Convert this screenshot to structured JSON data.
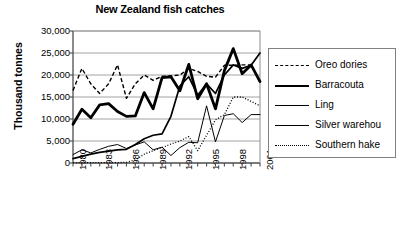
{
  "chart_data": {
    "type": "line",
    "title": "New Zealand fish catches",
    "xlabel": "",
    "ylabel": "Thousand tonnes",
    "ylim": [
      0,
      30000
    ],
    "ytick_labels": [
      "30,000",
      "25,000",
      "20,000",
      "15,000",
      "10,000",
      "5,000",
      "0"
    ],
    "ytick_values": [
      30000,
      25000,
      20000,
      15000,
      10000,
      5000,
      0
    ],
    "grid": "horizontal",
    "legend_position": "right",
    "x": [
      1980,
      1981,
      1982,
      1983,
      1984,
      1985,
      1986,
      1987,
      1988,
      1989,
      1990,
      1991,
      1992,
      1993,
      1994,
      1995,
      1996,
      1997,
      1998,
      1999,
      2000,
      2001
    ],
    "xtick_labels": [
      "1980",
      "1983",
      "1986",
      "1989",
      "1992",
      "1995",
      "1998",
      "2001"
    ],
    "xtick_values": [
      1980,
      1983,
      1986,
      1989,
      1992,
      1995,
      1998,
      2001
    ],
    "series": [
      {
        "name": "Oreo dories",
        "style": "dashed",
        "width": 1.4,
        "color": "#000000",
        "values": [
          16500,
          21500,
          18000,
          15800,
          18000,
          22300,
          14700,
          18000,
          20000,
          18800,
          19700,
          19800,
          20000,
          21500,
          20800,
          19700,
          19500,
          22200,
          22200,
          22300,
          22300,
          null
        ]
      },
      {
        "name": "Barracouta",
        "style": "solid",
        "width": 2.8,
        "color": "#000000",
        "values": [
          8800,
          12200,
          10300,
          13200,
          13500,
          11700,
          10600,
          10700,
          16000,
          12300,
          19400,
          19600,
          16400,
          22400,
          14600,
          18000,
          12300,
          21000,
          26000,
          20300,
          22300,
          18500
        ]
      },
      {
        "name": "Ling",
        "style": "solid",
        "width": 1.7,
        "color": "#000000",
        "values": [
          1000,
          1500,
          2000,
          2400,
          2700,
          3000,
          3100,
          4200,
          5500,
          6300,
          6600,
          10600,
          17500,
          19600,
          15400,
          18000,
          15800,
          20000,
          22300,
          21500,
          22200,
          25000
        ]
      },
      {
        "name": "Silver warehou",
        "style": "solid",
        "width": 1.0,
        "color": "#000000",
        "values": [
          1900,
          3000,
          2300,
          3100,
          3800,
          4200,
          3300,
          4100,
          4800,
          3000,
          3600,
          1700,
          3500,
          4700,
          4600,
          13000,
          4800,
          10800,
          11200,
          9200,
          11000,
          11000
        ]
      },
      {
        "name": "Southern hake",
        "style": "dotted",
        "width": 1.3,
        "color": "#000000",
        "values": [
          100,
          100,
          100,
          100,
          100,
          100,
          150,
          700,
          2000,
          2800,
          3500,
          4300,
          5000,
          6000,
          2800,
          6300,
          9800,
          11000,
          15000,
          15000,
          14000,
          13000
        ]
      }
    ]
  }
}
